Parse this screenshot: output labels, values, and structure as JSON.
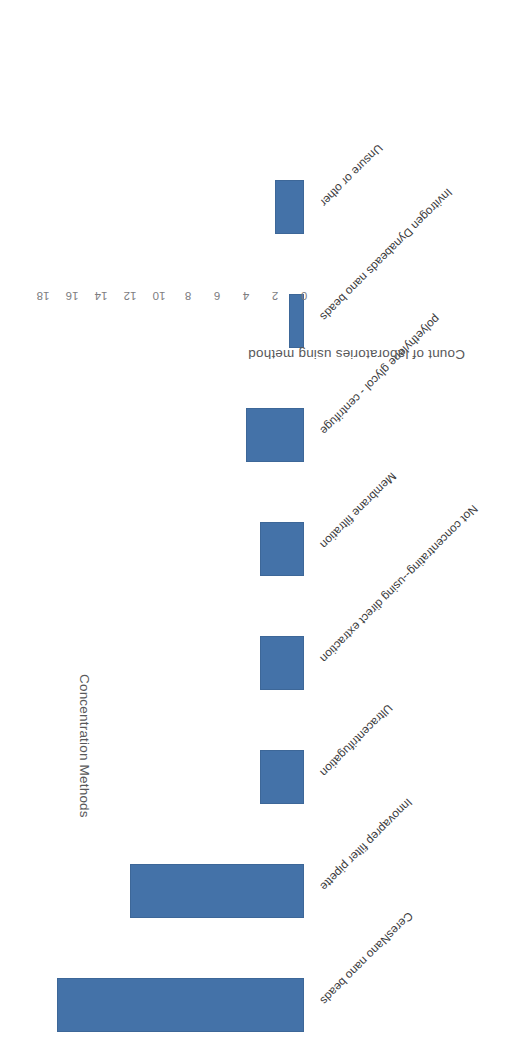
{
  "chart_data": {
    "type": "bar",
    "orientation": "vertical",
    "title": "",
    "xlabel": "Concentration Methods",
    "ylabel": "Count of laboratories using method",
    "ylim": [
      0,
      18
    ],
    "ytick_step": 2,
    "grid": false,
    "legend": false,
    "bar_color": "#4472a8",
    "categories": [
      "CeresNano nano beads",
      "Innovaprep filter pipette",
      "Ultracentrifugation",
      "Not concentrating--using direct extraction",
      "Membrane filtration",
      "polyethylene glycol - centrifuge",
      "Invitrogen Dynabeads nano beads",
      "Unsure or other"
    ],
    "values": [
      17,
      12,
      3,
      3,
      3,
      4,
      1,
      2
    ],
    "ytick_labels": [
      "0",
      "2",
      "4",
      "6",
      "8",
      "10",
      "12",
      "14",
      "16",
      "18"
    ]
  },
  "axes": {
    "category_axis_title": "Concentration Methods",
    "value_axis_title": "Count of laboratories using method"
  },
  "page": {
    "rotation_degrees": 180,
    "background": "#ffffff"
  }
}
